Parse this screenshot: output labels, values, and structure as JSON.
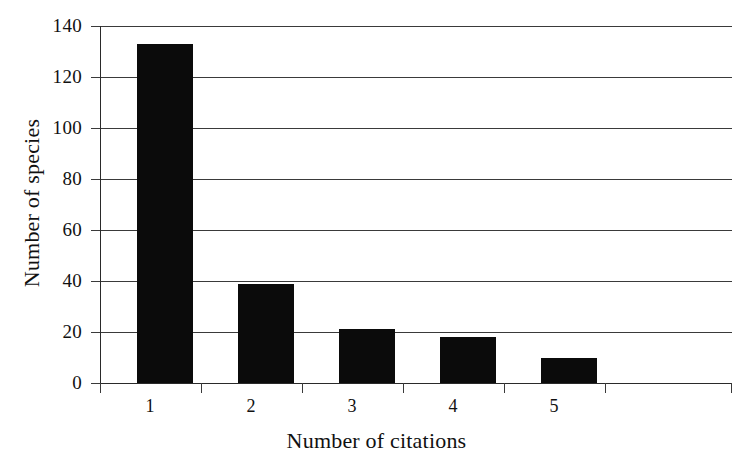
{
  "chart_data": {
    "type": "bar",
    "title": "",
    "xlabel": "Number of citations",
    "ylabel": "Number of species",
    "categories": [
      "1",
      "2",
      "3",
      "4",
      "5"
    ],
    "values": [
      133,
      39,
      21,
      18,
      10
    ],
    "series": [
      {
        "name": "Number of species",
        "values": [
          133,
          39,
          21,
          18,
          10
        ]
      }
    ],
    "ylim": [
      0,
      140
    ],
    "ytick_labels": [
      "140",
      "120",
      "100",
      "80",
      "60",
      "40",
      "20",
      "0"
    ],
    "ytick_values": [
      140,
      120,
      100,
      80,
      60,
      40,
      20,
      0
    ],
    "xtick_labels": [
      "1",
      "2",
      "3",
      "4",
      "5"
    ],
    "grid": "horizontal",
    "legend": "none",
    "bar_color": "#0b0b0b",
    "axis_color": "#2a2a2a",
    "background_color": "#ffffff"
  }
}
